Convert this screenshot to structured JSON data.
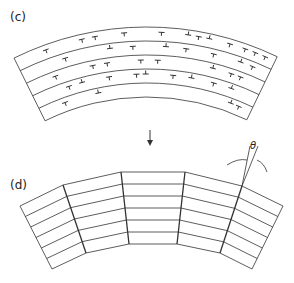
{
  "panels": [
    {
      "label": "(c)",
      "description": "curved layered band with dislocation symbols"
    },
    {
      "label": "(d)",
      "description": "polygonized layered band with tilt boundaries"
    }
  ],
  "annotation": {
    "angle_symbol": "θ"
  },
  "colors": {
    "line": "#333333",
    "background": "#ffffff"
  }
}
